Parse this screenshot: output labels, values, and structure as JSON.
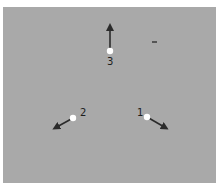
{
  "diagram": {
    "background_color": "#a9a9a9",
    "arrow_color": "#2b2b2b",
    "point_color": "#ffffff",
    "points": [
      {
        "label": "1",
        "x": 147,
        "y": 117,
        "arrow_to": [
          170,
          130
        ]
      },
      {
        "label": "2",
        "x": 73,
        "y": 118,
        "arrow_to": [
          51,
          130
        ]
      },
      {
        "label": "3",
        "x": 110,
        "y": 51,
        "arrow_to": [
          110,
          21
        ]
      }
    ],
    "speck": {
      "x": 154,
      "y": 42
    }
  }
}
